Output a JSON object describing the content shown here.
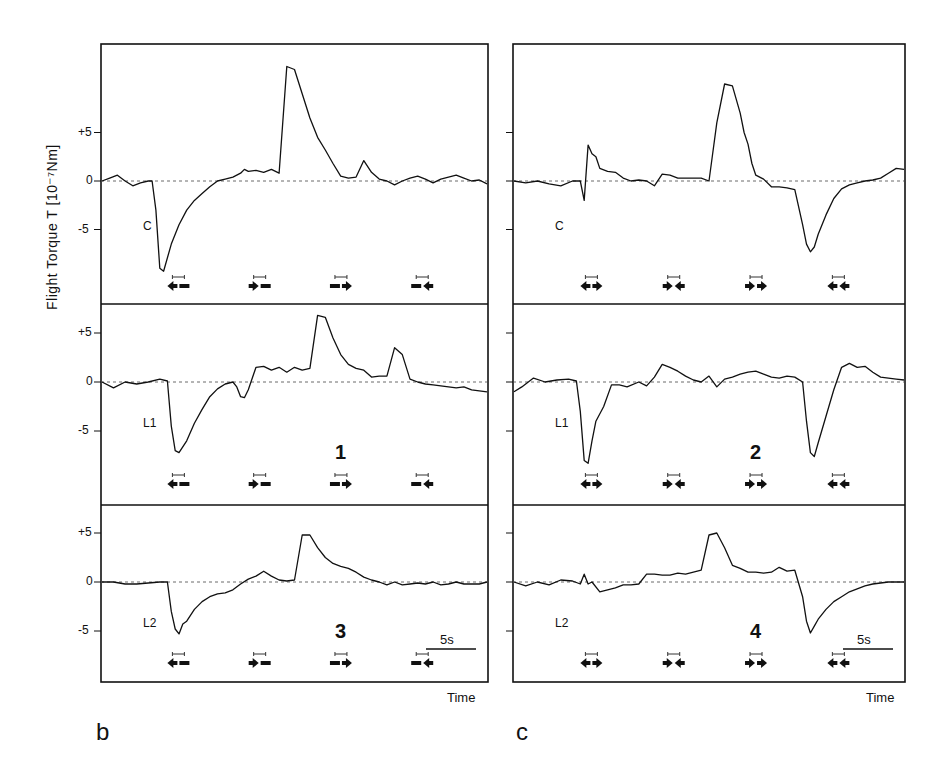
{
  "figure": {
    "y_axis_label": "Flight Torque T [10⁻⁷Nm]",
    "x_axis_label": "Time",
    "panel_letters": [
      "b",
      "c"
    ],
    "scale_bar": "5s",
    "ticks": [
      "+5",
      "0",
      "-5"
    ]
  },
  "chart_data": {
    "type": "line",
    "ylabel": "Flight Torque T [10^-7 Nm]",
    "xlabel": "Time",
    "ylim": [
      -10,
      12
    ],
    "grid": false,
    "zero_line": "dashed",
    "scale_bar_seconds": 5,
    "panels": [
      {
        "column": "b",
        "row": 0,
        "condition": "C",
        "number": "",
        "stimuli": [
          "◀— (front-to-back left)",
          "▶—",
          "—▶",
          "—◀"
        ],
        "stimulus_glyphs": [
          [
            "L",
            "-"
          ],
          [
            "R",
            "-"
          ],
          [
            "-",
            "R"
          ],
          [
            "-",
            "L"
          ]
        ],
        "x": [
          0,
          2,
          4,
          6,
          8,
          10,
          12,
          13,
          14,
          15,
          16,
          18,
          20,
          22,
          24,
          26,
          28,
          30,
          32,
          34,
          36,
          37,
          38,
          40,
          42,
          44,
          46,
          48,
          50,
          52,
          54,
          56,
          58,
          60,
          62,
          64,
          66,
          68,
          70,
          72,
          74,
          76,
          78,
          80,
          82,
          84,
          86,
          88,
          90,
          92,
          94,
          96,
          98,
          100
        ],
        "values": [
          0,
          0.3,
          0.6,
          0,
          -0.5,
          -0.2,
          0,
          0,
          -3,
          -9,
          -9.3,
          -6.5,
          -4.5,
          -3,
          -2,
          -1.3,
          -0.6,
          0,
          0.2,
          0.4,
          0.8,
          1.2,
          1.0,
          1.1,
          0.9,
          1.2,
          0.8,
          11.8,
          11.5,
          9,
          6.5,
          4.5,
          3.2,
          1.8,
          0.5,
          0.3,
          0.4,
          2.1,
          0.9,
          0.2,
          0,
          -0.4,
          0,
          0.3,
          0.5,
          0.2,
          -0.2,
          0.2,
          0.4,
          0.6,
          0.3,
          0,
          0.1,
          -0.3
        ]
      },
      {
        "column": "b",
        "row": 1,
        "condition": "L1",
        "number": "1",
        "stimulus_glyphs": [
          [
            "L",
            "-"
          ],
          [
            "R",
            "-"
          ],
          [
            "-",
            "R"
          ],
          [
            "-",
            "L"
          ]
        ],
        "x": [
          0,
          3,
          6,
          9,
          12,
          15,
          17,
          18,
          19,
          20,
          22,
          24,
          26,
          28,
          30,
          32,
          34,
          35,
          36,
          37,
          38,
          40,
          42,
          44,
          46,
          48,
          50,
          52,
          54,
          56,
          58,
          60,
          62,
          64,
          66,
          68,
          70,
          72,
          74,
          76,
          78,
          80,
          82,
          84,
          86,
          88,
          90,
          92,
          94,
          96,
          98,
          100
        ],
        "values": [
          0,
          -0.6,
          0,
          -0.2,
          0,
          0.3,
          0.1,
          -4.5,
          -7,
          -7.2,
          -6,
          -4.2,
          -2.8,
          -1.5,
          -0.7,
          -0.2,
          0,
          -0.5,
          -1.5,
          -1.6,
          -0.8,
          1.5,
          1.6,
          1.2,
          1.5,
          1.0,
          1.5,
          1.2,
          1.4,
          6.8,
          6.6,
          4.5,
          2.8,
          1.8,
          1.4,
          1.2,
          0.5,
          0.6,
          0.6,
          3.5,
          2.8,
          0.3,
          0,
          -0.2,
          -0.3,
          -0.4,
          -0.5,
          -0.6,
          -0.5,
          -0.8,
          -0.9,
          -1.0
        ]
      },
      {
        "column": "b",
        "row": 2,
        "condition": "L2",
        "number": "3",
        "stimulus_glyphs": [
          [
            "L",
            "-"
          ],
          [
            "R",
            "-"
          ],
          [
            "-",
            "R"
          ],
          [
            "-",
            "L"
          ]
        ],
        "x": [
          0,
          3,
          6,
          9,
          12,
          15,
          17,
          18,
          19,
          20,
          21,
          22,
          24,
          26,
          28,
          30,
          32,
          34,
          36,
          38,
          40,
          42,
          44,
          46,
          48,
          50,
          52,
          54,
          56,
          58,
          60,
          62,
          64,
          66,
          68,
          70,
          72,
          74,
          76,
          78,
          80,
          82,
          84,
          86,
          88,
          90,
          92,
          94,
          96,
          98,
          100
        ],
        "values": [
          0,
          0,
          -0.2,
          -0.2,
          -0.1,
          0,
          0,
          -3,
          -4.8,
          -5.3,
          -4.3,
          -4,
          -2.8,
          -2.0,
          -1.5,
          -1.2,
          -1.1,
          -0.8,
          -0.2,
          0.3,
          0.6,
          1.1,
          0.6,
          0.2,
          0.1,
          0.2,
          4.8,
          4.8,
          3.5,
          2.5,
          1.9,
          1.6,
          1.4,
          1.0,
          0.5,
          0.2,
          0,
          -0.3,
          0,
          -0.3,
          -0.2,
          -0.1,
          -0.2,
          0,
          -0.3,
          -0.2,
          0,
          -0.2,
          -0.2,
          -0.2,
          0
        ]
      },
      {
        "column": "c",
        "row": 0,
        "condition": "C",
        "number": "",
        "stimulus_glyphs": [
          [
            "L",
            "R"
          ],
          [
            "R",
            "L"
          ],
          [
            "R",
            "R"
          ],
          [
            "L",
            "L"
          ]
        ],
        "x": [
          0,
          3,
          6,
          9,
          12,
          15,
          17,
          18,
          19,
          20,
          21,
          22,
          24,
          26,
          28,
          30,
          32,
          34,
          36,
          38,
          40,
          42,
          44,
          46,
          48,
          50,
          52,
          54,
          56,
          58,
          59,
          60,
          61,
          62,
          64,
          66,
          68,
          70,
          72,
          74,
          75,
          76,
          77,
          78,
          80,
          82,
          84,
          86,
          88,
          90,
          92,
          94,
          96,
          98,
          100
        ],
        "values": [
          0,
          -0.2,
          0,
          -0.3,
          -0.5,
          0,
          0,
          -2,
          3.7,
          2.8,
          2.5,
          1.3,
          1.0,
          0.9,
          0.3,
          0,
          0.1,
          0,
          -0.5,
          0.7,
          0.6,
          0.3,
          0.3,
          0.3,
          0.3,
          0,
          6,
          10.0,
          9.8,
          7,
          5,
          3.8,
          1.8,
          0.6,
          0.2,
          -0.6,
          -0.6,
          -0.7,
          -0.9,
          -4.5,
          -6.5,
          -7.3,
          -6.8,
          -5.5,
          -3.5,
          -1.8,
          -0.8,
          -0.4,
          -0.2,
          0,
          0.1,
          0.3,
          0.8,
          1.3,
          1.2
        ]
      },
      {
        "column": "c",
        "row": 1,
        "condition": "L1",
        "number": "2",
        "stimulus_glyphs": [
          [
            "L",
            "R"
          ],
          [
            "R",
            "L"
          ],
          [
            "R",
            "R"
          ],
          [
            "L",
            "L"
          ]
        ],
        "x": [
          0,
          2,
          5,
          8,
          11,
          14,
          16,
          17,
          18,
          19,
          20,
          21,
          23,
          25,
          27,
          29,
          32,
          34,
          36,
          38,
          40,
          42,
          44,
          46,
          48,
          50,
          52,
          54,
          56,
          58,
          60,
          62,
          64,
          66,
          68,
          70,
          72,
          74,
          75,
          76,
          77,
          78,
          80,
          82,
          84,
          86,
          88,
          90,
          92,
          94,
          96,
          98,
          100
        ],
        "values": [
          -1.0,
          -0.5,
          0.4,
          0,
          0.2,
          0.3,
          0.1,
          -3,
          -8,
          -8.3,
          -6,
          -4,
          -2.5,
          -0.3,
          -0.3,
          -0.5,
          0,
          -0.4,
          0.5,
          1.8,
          1.5,
          1.1,
          0.6,
          0.2,
          0,
          0.6,
          -0.5,
          0.3,
          0.5,
          0.8,
          1.0,
          1.1,
          0.8,
          0.5,
          0.4,
          0.6,
          0.5,
          0,
          -4,
          -7.2,
          -7.6,
          -6.2,
          -3.5,
          -0.8,
          1.5,
          1.9,
          1.5,
          1.6,
          1.0,
          0.5,
          0.4,
          0.3,
          0.2
        ]
      },
      {
        "column": "c",
        "row": 2,
        "condition": "L2",
        "number": "4",
        "stimulus_glyphs": [
          [
            "L",
            "R"
          ],
          [
            "R",
            "L"
          ],
          [
            "R",
            "R"
          ],
          [
            "L",
            "L"
          ]
        ],
        "x": [
          0,
          3,
          6,
          9,
          12,
          15,
          17,
          18,
          19,
          20,
          22,
          24,
          26,
          28,
          30,
          32,
          34,
          36,
          38,
          40,
          42,
          44,
          46,
          48,
          50,
          52,
          54,
          56,
          58,
          60,
          62,
          64,
          66,
          68,
          70,
          72,
          74,
          75,
          76,
          77,
          78,
          80,
          82,
          84,
          86,
          88,
          90,
          92,
          94,
          96,
          98,
          100
        ],
        "values": [
          0,
          -0.4,
          0,
          -0.3,
          0.2,
          0.1,
          -0.2,
          0.8,
          -0.2,
          0,
          -1.0,
          -0.8,
          -0.6,
          -0.3,
          -0.3,
          -0.2,
          0.8,
          0.8,
          0.7,
          0.7,
          0.9,
          0.8,
          1.0,
          1.2,
          4.8,
          5.0,
          3.5,
          1.7,
          1.4,
          1.0,
          1.0,
          0.9,
          1.0,
          1.5,
          1.1,
          1.2,
          -1.5,
          -4,
          -5.2,
          -4.5,
          -3.8,
          -2.8,
          -2.0,
          -1.5,
          -1.0,
          -0.7,
          -0.4,
          -0.2,
          -0.1,
          0,
          0,
          0,
          0
        ]
      }
    ]
  }
}
